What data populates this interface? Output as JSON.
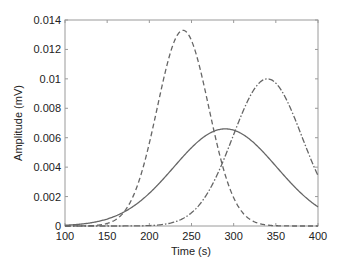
{
  "chart_data": {
    "type": "line",
    "title": "",
    "xlabel": "Time (s)",
    "ylabel": "Amplitude (mV)",
    "xlim": [
      100,
      400
    ],
    "ylim": [
      0,
      0.014
    ],
    "xticks": [
      100,
      150,
      200,
      250,
      300,
      350,
      400
    ],
    "xtick_labels": [
      "100",
      "150",
      "200",
      "250",
      "300",
      "350",
      "400"
    ],
    "yticks": [
      0,
      0.002,
      0.004,
      0.006,
      0.008,
      0.01,
      0.012,
      0.014
    ],
    "ytick_labels": [
      "0",
      "0.002",
      "0.004",
      "0.006",
      "0.008",
      "0.01",
      "0.012",
      "0.014"
    ],
    "grid": false,
    "legend": null,
    "series": [
      {
        "name": "dashed",
        "style": "dashed",
        "color": "#666666",
        "shape": "gaussian",
        "peak_x": 240,
        "peak_y": 0.0133,
        "sigma": 30.5,
        "x": [
          100,
          150,
          170,
          190,
          210,
          225,
          240,
          255,
          270,
          290,
          310,
          330,
          350,
          400
        ],
        "values": [
          0.0,
          0.0002,
          0.0009,
          0.0034,
          0.0082,
          0.0118,
          0.0133,
          0.0118,
          0.0082,
          0.0034,
          0.0009,
          0.0002,
          0.0,
          0.0
        ]
      },
      {
        "name": "solid",
        "style": "solid",
        "color": "#666666",
        "shape": "gaussian",
        "peak_x": 290,
        "peak_y": 0.0066,
        "sigma": 61,
        "x": [
          100,
          150,
          200,
          250,
          290,
          330,
          370,
          400
        ],
        "values": [
          0.0005,
          0.0017,
          0.0036,
          0.0053,
          0.0066,
          0.0053,
          0.0028,
          0.0013
        ]
      },
      {
        "name": "dash-dot",
        "style": "dashdot",
        "color": "#666666",
        "shape": "gaussian",
        "peak_x": 340,
        "peak_y": 0.01,
        "sigma": 41,
        "x": [
          100,
          200,
          250,
          280,
          300,
          320,
          340,
          360,
          380,
          400
        ],
        "values": [
          0.0,
          0.0003,
          0.0009,
          0.0034,
          0.0062,
          0.0089,
          0.01,
          0.0089,
          0.0062,
          0.0034
        ]
      }
    ]
  },
  "layout": {
    "plot_left": 65,
    "plot_right": 318,
    "plot_top": 20,
    "plot_bottom": 226,
    "axis_color": "#9a9a9a",
    "text_color": "#222222"
  }
}
